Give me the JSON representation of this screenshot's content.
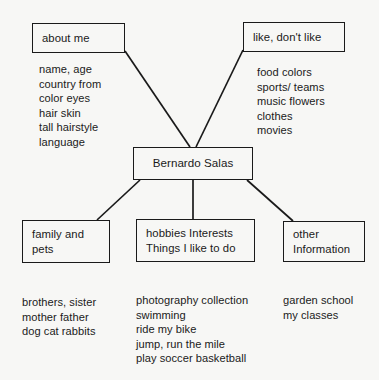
{
  "diagram": {
    "title": "Bernardo Salas",
    "type": "concept-map",
    "center": {
      "label": "Bernardo Salas"
    },
    "branches": [
      {
        "id": "about-me",
        "box_lines": [
          "about me"
        ],
        "detail_lines": [
          "name, age",
          "country  from",
          "color eyes",
          "hair skin",
          "tall hairstyle",
          "language"
        ]
      },
      {
        "id": "like-dont-like",
        "box_lines": [
          "like, don't like"
        ],
        "detail_lines": [
          "food colors",
          "sports/ teams",
          "music  flowers",
          "clothes",
          "movies"
        ]
      },
      {
        "id": "family-and-pets",
        "box_lines": [
          "family and",
          "pets"
        ],
        "detail_lines": [
          "brothers, sister",
          "mother father",
          "dog cat rabbits"
        ]
      },
      {
        "id": "hobbies-interests",
        "box_lines": [
          "hobbies Interests",
          "Things I like to do"
        ],
        "detail_lines": [
          "photography collection",
          "swimming",
          "ride my bike",
          "jump, run the mile",
          "play soccer basketball"
        ]
      },
      {
        "id": "other-information",
        "box_lines": [
          "other",
          "Information"
        ],
        "detail_lines": [
          "garden school",
          "my classes"
        ]
      }
    ],
    "colors": {
      "background": "#f7f7f5",
      "ink": "#1a1a1a",
      "line": "#1a1a1a"
    }
  }
}
